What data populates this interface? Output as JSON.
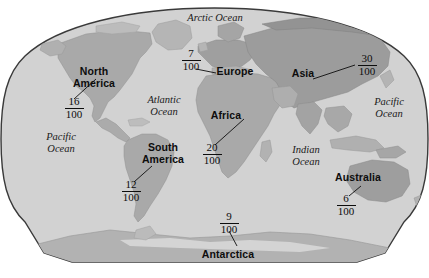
{
  "figure": {
    "projection": "oval-world-map",
    "colors": {
      "ocean": "#d2d2d2",
      "land": "#a9a9a9",
      "land_dark": "#989898",
      "land_light": "#bdbdbd",
      "outline": "#3a3a3a",
      "text": "#0d0d0d",
      "background": "#ffffff"
    }
  },
  "continents": [
    {
      "name": "North America",
      "name_line1": "North",
      "name_line2": "America",
      "numerator": "16",
      "denominator": "100",
      "fraction": "16/100"
    },
    {
      "name": "South America",
      "name_line1": "South",
      "name_line2": "America",
      "numerator": "12",
      "denominator": "100",
      "fraction": "12/100"
    },
    {
      "name": "Europe",
      "name_line1": "Europe",
      "name_line2": "",
      "numerator": "7",
      "denominator": "100",
      "fraction": "7/100"
    },
    {
      "name": "Africa",
      "name_line1": "Africa",
      "name_line2": "",
      "numerator": "20",
      "denominator": "100",
      "fraction": "20/100"
    },
    {
      "name": "Asia",
      "name_line1": "Asia",
      "name_line2": "",
      "numerator": "30",
      "denominator": "100",
      "fraction": "30/100"
    },
    {
      "name": "Australia",
      "name_line1": "Australia",
      "name_line2": "",
      "numerator": "6",
      "denominator": "100",
      "fraction": "6/100"
    },
    {
      "name": "Antarctica",
      "name_line1": "Antarctica",
      "name_line2": "",
      "numerator": "9",
      "denominator": "100",
      "fraction": "9/100"
    }
  ],
  "oceans": [
    {
      "name": "Arctic Ocean",
      "line1": "Arctic Ocean",
      "line2": ""
    },
    {
      "name": "Atlantic Ocean",
      "line1": "Atlantic",
      "line2": "Ocean"
    },
    {
      "name": "Pacific Ocean West",
      "line1": "Pacific",
      "line2": "Ocean"
    },
    {
      "name": "Pacific Ocean East",
      "line1": "Pacific",
      "line2": "Ocean"
    },
    {
      "name": "Indian Ocean",
      "line1": "Indian",
      "line2": "Ocean"
    }
  ]
}
